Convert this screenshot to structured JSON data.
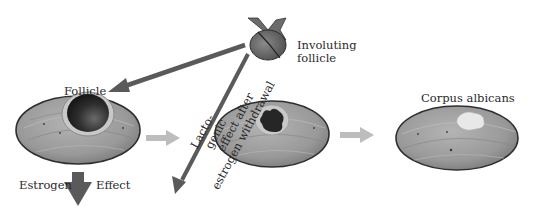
{
  "diagram": {
    "labels": {
      "involuting_follicle_line1": "Involuting",
      "involuting_follicle_line2": "follicle",
      "follicle": "Follicle",
      "estrogen": "Estrogen",
      "effect": "Effect",
      "lactogenic_line1": "Lacto-",
      "lactogenic_line2": "genic",
      "lactogenic_line3": "effect after",
      "lactogenic_line4": "estrogen withdrawal",
      "corpus_albicans": "Corpus albicans"
    },
    "colors": {
      "dark_arrow": "#5a5a5a",
      "light_arrow": "#bdbdbd",
      "ovary_fill": "#9c9c9c",
      "ovary_outline": "#2e2e2e",
      "follicle_cavity": "#2b2b2b",
      "scar": "#e6e6e6"
    },
    "nodes": [
      {
        "id": "involuting-follicle",
        "label": "Involuting follicle"
      },
      {
        "id": "ovary-with-follicle",
        "label": "Follicle"
      },
      {
        "id": "ovary-regressing-follicle",
        "label": ""
      },
      {
        "id": "ovary-corpus-albicans",
        "label": "Corpus albicans"
      }
    ],
    "edges": [
      {
        "from": "involuting-follicle",
        "to": "ovary-with-follicle",
        "style": "dark"
      },
      {
        "from": "involuting-follicle",
        "to": "lactogenic-effect",
        "label": "Lactogenic effect after estrogen withdrawal",
        "style": "dark"
      },
      {
        "from": "ovary-with-follicle",
        "to": "estrogen-effect",
        "label": "Estrogen Effect",
        "style": "dark-thick"
      },
      {
        "from": "ovary-with-follicle",
        "to": "ovary-regressing-follicle",
        "style": "light"
      },
      {
        "from": "ovary-regressing-follicle",
        "to": "ovary-corpus-albicans",
        "style": "light"
      }
    ]
  }
}
